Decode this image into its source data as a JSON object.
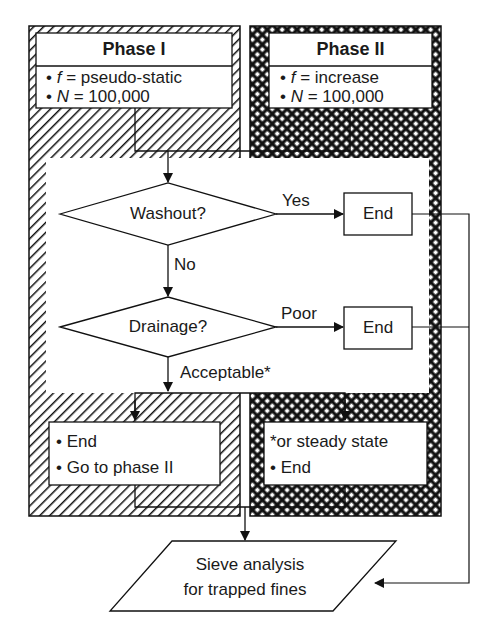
{
  "diagram": {
    "phase1": {
      "title": "Phase I",
      "bullets": [
        {
          "var": "f",
          "eq": " = pseudo-static"
        },
        {
          "var": "N",
          "eq": " = 100,000"
        }
      ],
      "outcome": [
        "End",
        "Go to phase II"
      ],
      "pattern": "diagonal-hatch"
    },
    "phase2": {
      "title": "Phase II",
      "bullets": [
        {
          "var": "f",
          "eq": " = increase"
        },
        {
          "var": "N",
          "eq": " = 100,000"
        }
      ],
      "outcome_note": "*or steady state",
      "outcome": [
        "End"
      ],
      "pattern": "cross-hatch"
    },
    "decisions": {
      "washout": {
        "label": "Washout?",
        "yes_label": "Yes",
        "no_label": "No",
        "yes_target": "End"
      },
      "drainage": {
        "label": "Drainage?",
        "poor_label": "Poor",
        "acceptable_label": "Acceptable*",
        "poor_target": "End"
      }
    },
    "final": {
      "line1": "Sieve analysis",
      "line2": "for trapped fines"
    },
    "bullet_char": "•",
    "colors": {
      "line": "#1a1a1a",
      "background": "#ffffff"
    }
  }
}
